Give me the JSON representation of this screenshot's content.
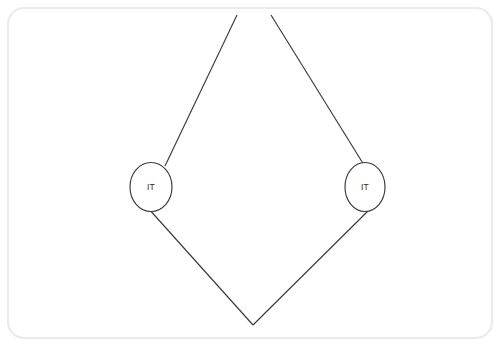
{
  "canvas": {
    "width": 500,
    "height": 346,
    "background_color": "#ffffff",
    "border_color": "#ebebeb",
    "border_radius": 16,
    "border_inset": 8
  },
  "diagram": {
    "type": "node-link-diagram",
    "shape": "diamond",
    "stroke_color": "#3a3a3a",
    "node_fill_color": "#ffffff",
    "label_color": "#2b2b2b",
    "nodes": [
      {
        "id": "node-left",
        "name": "left-it-node",
        "label": "IT",
        "shape": "ellipse",
        "cx": 151,
        "cy": 187,
        "rx": 21,
        "ry": 24.5
      },
      {
        "id": "node-right",
        "name": "right-it-node",
        "label": "IT",
        "shape": "ellipse",
        "cx": 365,
        "cy": 187,
        "rx": 20,
        "ry": 24.5
      }
    ],
    "edges": [
      {
        "id": "edge-upper-left",
        "name": "edge-upper-left",
        "x1": 237,
        "y1": 15,
        "x2": 165,
        "y2": 166,
        "clipped_at_top": true
      },
      {
        "id": "edge-upper-right",
        "name": "edge-upper-right",
        "x1": 271,
        "y1": 15,
        "x2": 364,
        "y2": 165,
        "clipped_at_top": true
      },
      {
        "id": "edge-lower-left",
        "name": "edge-lower-left",
        "x1": 148,
        "y1": 208,
        "x2": 253,
        "y2": 325,
        "clipped_at_top": false
      },
      {
        "id": "edge-lower-right",
        "name": "edge-lower-right",
        "x1": 372,
        "y1": 207,
        "x2": 253,
        "y2": 325,
        "clipped_at_top": false
      }
    ],
    "vertices": {
      "bottom_apex_x": 253,
      "bottom_apex_y": 325,
      "top_gap_left_x": 237,
      "top_gap_right_x": 271,
      "top_clip_y": 15
    }
  }
}
